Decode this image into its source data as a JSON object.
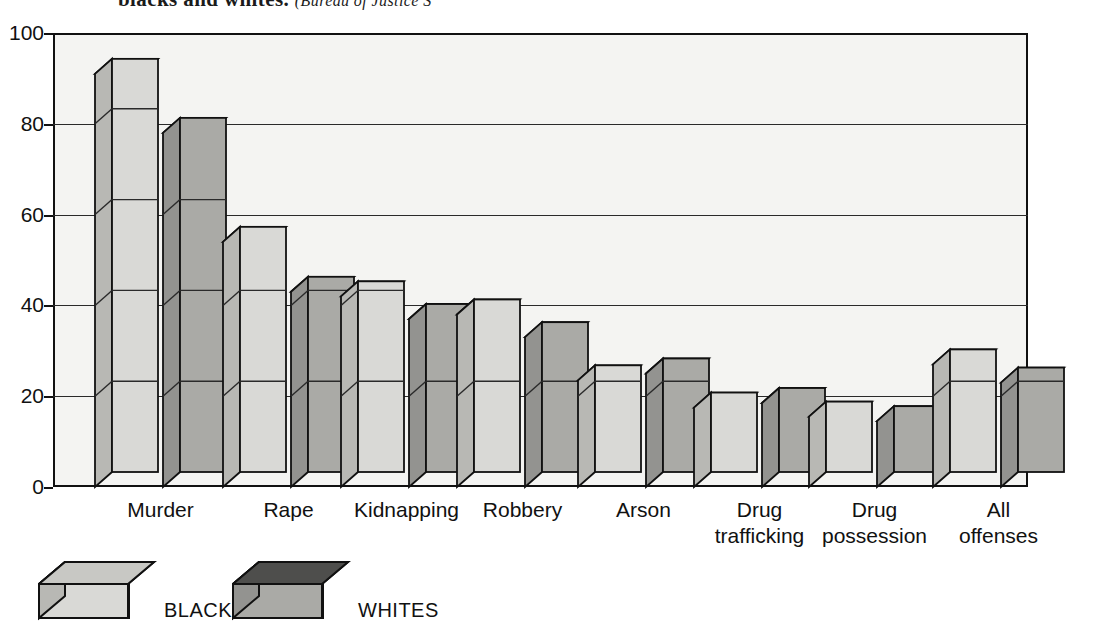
{
  "caption": {
    "line_fragment": "blacks and whites.",
    "line_fragment_italic": "(Bureau of Justice S"
  },
  "chart_data": {
    "type": "bar",
    "title": "",
    "subtitle": "",
    "xlabel": "",
    "ylabel": "",
    "ylim": [
      0,
      100
    ],
    "yticks": [
      0,
      20,
      40,
      60,
      80,
      100
    ],
    "grid": true,
    "legend_position": "bottom-left",
    "style": "3d-isometric-grouped-column",
    "categories": [
      "Murder",
      "Rape",
      "Kidnapping",
      "Robbery",
      "Arson",
      "Drug trafficking",
      "Drug possession",
      "All offenses"
    ],
    "series": [
      {
        "name": "BLACKS",
        "color": "#d9d9d6",
        "side_color": "#b8b8b4",
        "top_color": "#c8c8c4",
        "values": [
          91,
          54,
          42,
          38,
          23.5,
          17.5,
          15.5,
          27
        ]
      },
      {
        "name": "WHITES",
        "color": "#aaaaa6",
        "side_color": "#939390",
        "top_color": "#4e4e4c",
        "values": [
          78,
          43,
          37,
          33,
          25,
          18.5,
          14.5,
          23
        ]
      }
    ]
  },
  "axis": {
    "y_tick_labels": [
      "0",
      "20",
      "40",
      "60",
      "80",
      "100"
    ],
    "x_tick_labels": [
      "Murder",
      "Rape",
      "Kidnapping",
      "Robbery",
      "Arson",
      "Drug\ntrafficking",
      "Drug\npossession",
      "All\noffenses"
    ]
  },
  "legend": {
    "items": [
      {
        "label": "BLACKS",
        "swatch": "light-gray-3d-box"
      },
      {
        "label": "WHITES",
        "swatch": "dark-top-3d-box"
      }
    ]
  }
}
